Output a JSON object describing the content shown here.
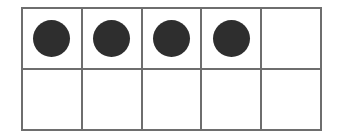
{
  "figure": {
    "name": "ten-frame",
    "rows": 2,
    "columns": 5,
    "total_cells": 10,
    "filled_count": 4,
    "empty_count": 6,
    "represented_number": "4",
    "colors": {
      "background": "#ffffff",
      "grid_line": "#6e6e6e",
      "counter_fill": "#2e2e2e"
    },
    "cells": [
      {
        "row": 1,
        "column": 1,
        "filled": true,
        "label": ""
      },
      {
        "row": 1,
        "column": 2,
        "filled": true,
        "label": ""
      },
      {
        "row": 1,
        "column": 3,
        "filled": true,
        "label": ""
      },
      {
        "row": 1,
        "column": 4,
        "filled": true,
        "label": ""
      },
      {
        "row": 1,
        "column": 5,
        "filled": false,
        "label": ""
      },
      {
        "row": 2,
        "column": 1,
        "filled": false,
        "label": ""
      },
      {
        "row": 2,
        "column": 2,
        "filled": false,
        "label": ""
      },
      {
        "row": 2,
        "column": 3,
        "filled": false,
        "label": ""
      },
      {
        "row": 2,
        "column": 4,
        "filled": false,
        "label": ""
      },
      {
        "row": 2,
        "column": 5,
        "filled": false,
        "label": ""
      }
    ]
  }
}
